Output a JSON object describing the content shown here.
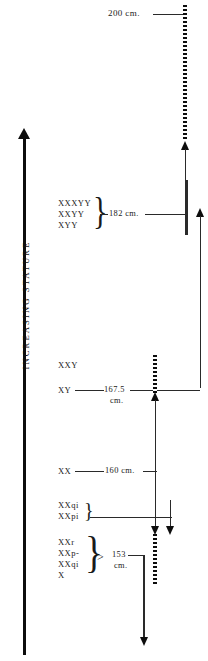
{
  "figure": {
    "axis_label": "INCREASING STATURE",
    "measurements": [
      {
        "id": "m-200",
        "value": "200 cm."
      },
      {
        "id": "m-182",
        "value": "182 cm."
      },
      {
        "id": "m-167",
        "value": "167.5",
        "unit": "cm."
      },
      {
        "id": "m-160",
        "value": "160 cm."
      },
      {
        "id": "m-153",
        "comparator": ">",
        "value": "153",
        "unit": "cm."
      }
    ],
    "genotype_groups": [
      {
        "id": "group-tall",
        "labels": [
          "XXXYY",
          "XXYY",
          "XYY"
        ],
        "brace": "}",
        "measurement": "182 cm."
      },
      {
        "id": "group-xxy",
        "labels": [
          "XXY"
        ]
      },
      {
        "id": "group-xy",
        "labels": [
          "XY"
        ],
        "measurement": "167.5 cm."
      },
      {
        "id": "group-xx",
        "labels": [
          "XX"
        ],
        "measurement": "160 cm."
      },
      {
        "id": "group-xxqi-xxpi",
        "labels": [
          "XXqi",
          "XXpi"
        ],
        "brace": "}"
      },
      {
        "id": "group-short",
        "labels": [
          "XXr",
          "XXp-",
          "XXqi",
          "X"
        ],
        "brace": "}",
        "comparator": ">",
        "measurement": "153 cm."
      }
    ]
  }
}
